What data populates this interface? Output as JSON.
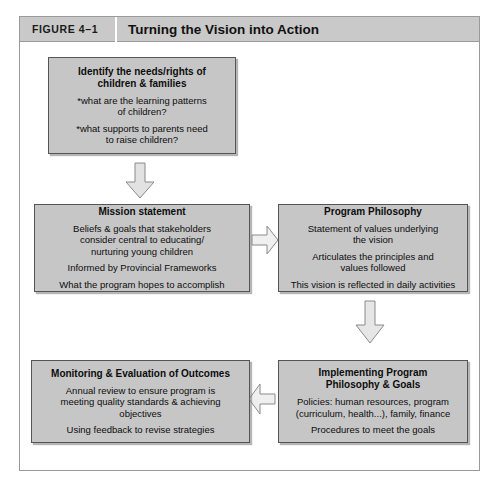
{
  "figure": {
    "label": "FIGURE 4–1",
    "title": "Turning the Vision into Action"
  },
  "nodes": {
    "identify": {
      "title": "Identify the needs/rights of\nchildren & families",
      "lines": [
        "*what are the learning patterns\nof children?",
        "*what supports to parents need\nto raise children?"
      ]
    },
    "mission": {
      "title": "Mission statement",
      "lines": [
        "Beliefs & goals that stakeholders\nconsider central to educating/\nnurturing young children",
        "Informed by Provincial Frameworks",
        "What the program hopes to accomplish"
      ]
    },
    "philosophy": {
      "title": "Program Philosophy",
      "lines": [
        "Statement of values underlying\nthe vision",
        "Articulates the principles and\nvalues followed",
        "This vision is reflected in daily activities"
      ]
    },
    "implementing": {
      "title": "Implementing Program\nPhilosophy & Goals",
      "lines": [
        "Policies: human resources, program\n(curriculum, health...), family, finance",
        "Procedures to meet the goals"
      ]
    },
    "monitoring": {
      "title": "Monitoring & Evaluation of Outcomes",
      "lines": [
        "Annual review to ensure program is\nmeeting quality standards & achieving\nobjectives",
        "Using feedback to revise strategies"
      ]
    }
  },
  "arrows": [
    {
      "name": "identify-to-mission",
      "direction": "down"
    },
    {
      "name": "mission-to-philosophy",
      "direction": "right"
    },
    {
      "name": "philosophy-to-implementing",
      "direction": "down"
    },
    {
      "name": "implementing-to-monitoring",
      "direction": "left"
    }
  ],
  "colors": {
    "box_fill": "#c6c6c6",
    "box_border": "#555555",
    "header_band": "#c9c9c9",
    "frame_border": "#9a9a9a",
    "arrow_fill": "#e2e2e2",
    "arrow_border": "#8a8a8a"
  }
}
